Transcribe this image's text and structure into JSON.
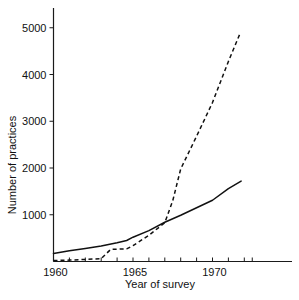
{
  "chart_data": {
    "type": "line",
    "title": "",
    "xlabel": "Year of survey",
    "ylabel": "Number of practices",
    "xlim": [
      1960,
      1972.5
    ],
    "ylim": [
      0,
      5600
    ],
    "grid": false,
    "legend": "none",
    "x_ticks_labeled": [
      "1960",
      "1965",
      "1970"
    ],
    "x_tick_values": [
      1960,
      1965,
      1970
    ],
    "x_minor_tick_values": [
      1961,
      1962,
      1963,
      1964,
      1966,
      1967,
      1968,
      1969,
      1971,
      1972
    ],
    "y_ticks_labeled": [
      "1000",
      "2000",
      "3000",
      "4000",
      "5000"
    ],
    "y_tick_values": [
      1000,
      2000,
      3000,
      4000,
      5000
    ],
    "series": [
      {
        "name": "solid-series",
        "style": "solid",
        "x": [
          1960,
          1961,
          1962,
          1963,
          1964,
          1964.6,
          1965,
          1966,
          1967,
          1968,
          1969,
          1970,
          1971,
          1971.8
        ],
        "values": [
          170,
          230,
          280,
          330,
          400,
          450,
          520,
          660,
          840,
          990,
          1150,
          1310,
          1560,
          1720
        ]
      },
      {
        "name": "dashed-series",
        "style": "dashed",
        "x": [
          1960,
          1961,
          1962,
          1963,
          1963.6,
          1964.6,
          1965,
          1966,
          1967,
          1967.5,
          1968,
          1969,
          1970,
          1971,
          1971.7
        ],
        "values": [
          20,
          30,
          45,
          60,
          260,
          270,
          340,
          560,
          830,
          1300,
          1980,
          2680,
          3400,
          4280,
          4850
        ]
      }
    ],
    "axis_color": "#111111",
    "background": "#ffffff"
  },
  "labels": {
    "y_axis_title": "Number of practices",
    "x_axis_title": "Year of survey"
  }
}
